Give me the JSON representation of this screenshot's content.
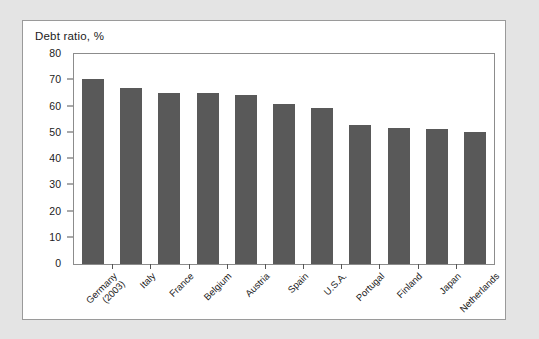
{
  "chart_data": {
    "type": "bar",
    "title": "Debt ratio, %",
    "xlabel": "",
    "ylabel": "",
    "ylim": [
      0,
      80
    ],
    "yticks": [
      0,
      10,
      20,
      30,
      40,
      50,
      60,
      70,
      80
    ],
    "ytick_labels": [
      "0",
      "10",
      "20",
      "30",
      "40",
      "50",
      "60",
      "70",
      "80"
    ],
    "grid": false,
    "legend": "none",
    "bar_color": "#595959",
    "categories": [
      "Germany\n(2003)",
      "Italy",
      "France",
      "Belgium",
      "Austria",
      "Spain",
      "U.S.A.",
      "Portugal",
      "Finland",
      "Japan",
      "Netherlands"
    ],
    "values": [
      70.3,
      67.0,
      65.0,
      65.0,
      64.5,
      61.0,
      59.5,
      53.0,
      52.0,
      51.5,
      50.3
    ]
  },
  "figure": {
    "background_color": "#e4e4e4",
    "card_color": "#ffffff",
    "frame_color": "#8c8c8c"
  }
}
